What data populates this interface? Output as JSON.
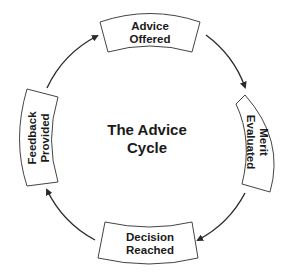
{
  "diagram": {
    "title_line1": "The Advice",
    "title_line2": "Cycle",
    "stages": [
      {
        "line1": "Advice",
        "line2": "Offered",
        "position": "top"
      },
      {
        "line1": "Merit",
        "line2": "Evaluated",
        "position": "right"
      },
      {
        "line1": "Decision",
        "line2": "Reached",
        "position": "bottom"
      },
      {
        "line1": "Feedback",
        "line2": "Provided",
        "position": "left"
      }
    ],
    "flow_direction": "clockwise",
    "colors": {
      "stroke": "#444444",
      "text": "#1a1a1a",
      "background": "#ffffff"
    }
  }
}
